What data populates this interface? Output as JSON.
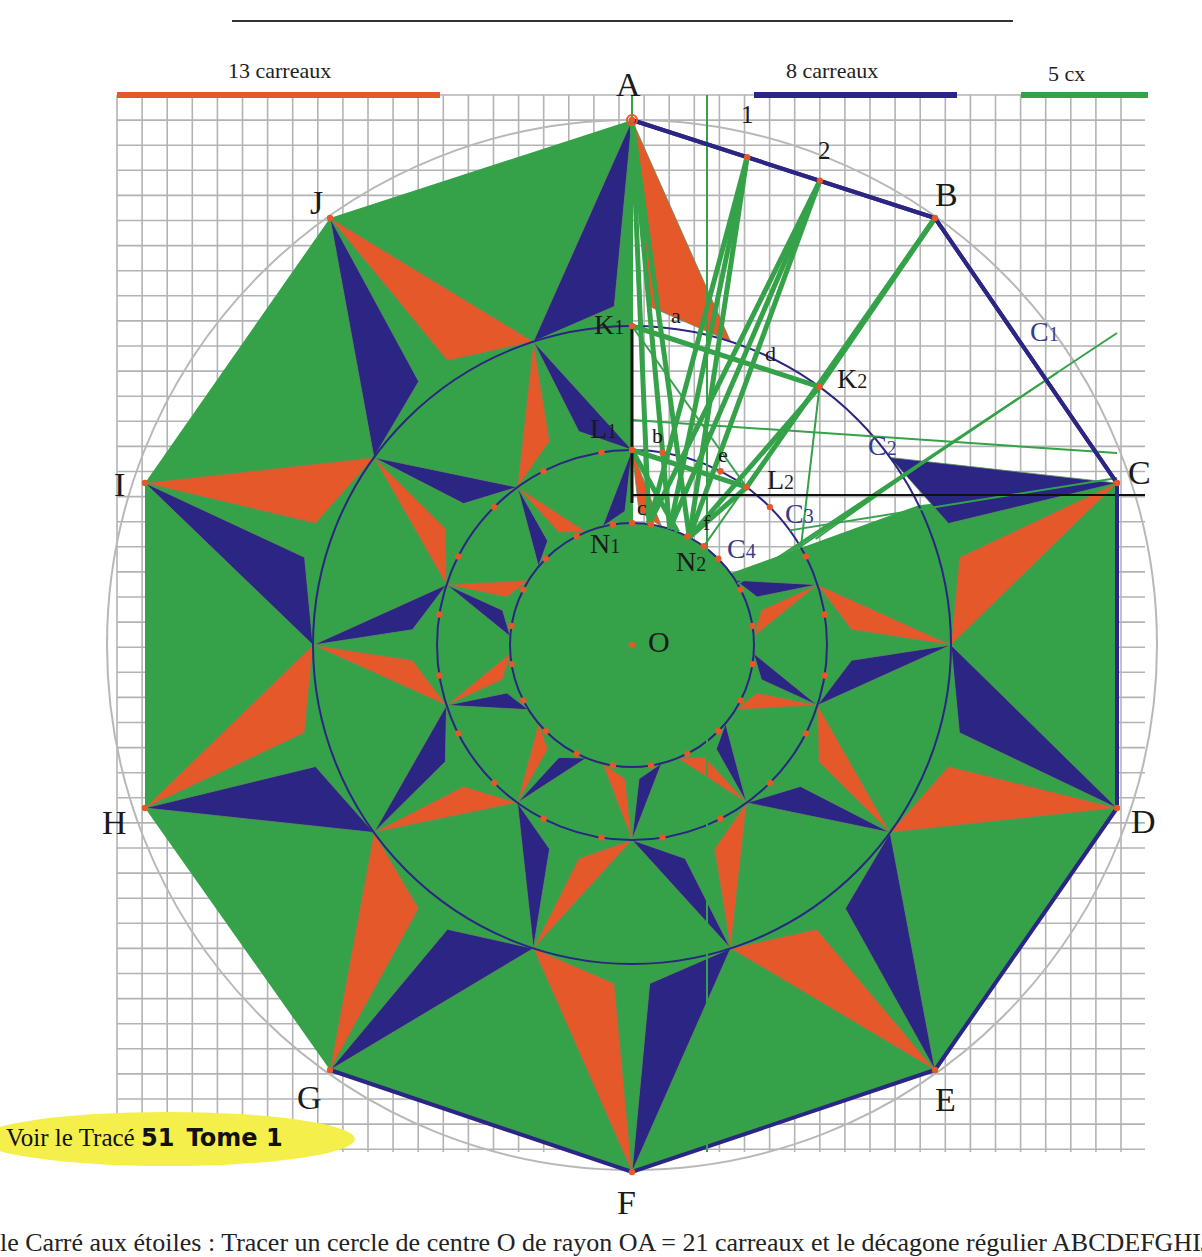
{
  "colors": {
    "green": "#35a24a",
    "orange": "#e4582a",
    "navy": "#2b2583",
    "grid": "#b3b3b3",
    "circle_grey": "#b8b8b8",
    "point": "#e4582a",
    "callout_bg": "#f4ef4a",
    "black": "#1a1a1a"
  },
  "geometry": {
    "center": [
      632,
      645
    ],
    "outer_radius": 525,
    "k_radius": 319,
    "l_radius": 195,
    "n_radius": 122,
    "grid": {
      "x0": 117,
      "y0": 95,
      "x1": 1145,
      "y1": 1152,
      "cell": 25.1
    }
  },
  "header_rule": {
    "x1": 232,
    "x2": 1013,
    "y": 21
  },
  "scales": [
    {
      "caption": "13 carreaux",
      "color": "#e4582a",
      "x1": 117,
      "x2": 440,
      "y": 95,
      "caption_x": 228,
      "caption_y": 58
    },
    {
      "caption": "8 carreaux",
      "color": "#2b2583",
      "x1": 754,
      "x2": 957,
      "y": 95,
      "caption_x": 786,
      "caption_y": 58
    },
    {
      "caption": "5 cx",
      "color": "#35a24a",
      "x1": 1021,
      "x2": 1148,
      "y": 95,
      "caption_x": 1048,
      "caption_y": 61
    }
  ],
  "vertices": [
    {
      "name": "A",
      "x": 632,
      "y": 120,
      "lx": 616,
      "ly": 68
    },
    {
      "name": "B",
      "x": 935,
      "y": 218,
      "lx": 935,
      "ly": 178
    },
    {
      "name": "C",
      "x": 1117,
      "y": 483,
      "lx": 1128,
      "ly": 456
    },
    {
      "name": "D",
      "x": 1117,
      "y": 808,
      "lx": 1131,
      "ly": 805
    },
    {
      "name": "E",
      "x": 935,
      "y": 1070,
      "lx": 935,
      "ly": 1083
    },
    {
      "name": "F",
      "x": 632,
      "y": 1172,
      "lx": 617,
      "ly": 1186
    },
    {
      "name": "G",
      "x": 330,
      "y": 1070,
      "lx": 297,
      "ly": 1081
    },
    {
      "name": "H",
      "x": 145,
      "y": 808,
      "lx": 102,
      "ly": 806
    },
    {
      "name": "I",
      "x": 145,
      "y": 483,
      "lx": 114,
      "ly": 468
    },
    {
      "name": "J",
      "x": 330,
      "y": 218,
      "lx": 310,
      "ly": 186
    }
  ],
  "labels": {
    "O": {
      "text": "O",
      "x": 648,
      "y": 627
    },
    "K1": {
      "main": "K",
      "sub": "1",
      "x": 594,
      "y": 311
    },
    "K2": {
      "main": "K",
      "sub": "2",
      "x": 837,
      "y": 365
    },
    "L1": {
      "main": "L",
      "sub": "1",
      "x": 590,
      "y": 415
    },
    "L2": {
      "main": "L",
      "sub": "2",
      "x": 767,
      "y": 466
    },
    "N1": {
      "main": "N",
      "sub": "1",
      "x": 590,
      "y": 530
    },
    "N2": {
      "main": "N",
      "sub": "2",
      "x": 676,
      "y": 548
    },
    "C1": {
      "main": "C",
      "sub": "1",
      "x": 1030,
      "y": 318
    },
    "C2": {
      "main": "C",
      "sub": "2",
      "x": 868,
      "y": 432
    },
    "C3": {
      "main": "C",
      "sub": "3",
      "x": 785,
      "y": 500
    },
    "C4": {
      "main": "C",
      "sub": "4",
      "x": 727,
      "y": 535
    },
    "a": {
      "text": "a",
      "x": 671,
      "y": 305
    },
    "b": {
      "text": "b",
      "x": 652,
      "y": 425
    },
    "c": {
      "text": "c",
      "x": 637,
      "y": 497
    },
    "d": {
      "text": "d",
      "x": 765,
      "y": 343
    },
    "e": {
      "text": "e",
      "x": 718,
      "y": 444
    },
    "f": {
      "text": "f",
      "x": 703,
      "y": 512
    },
    "1": {
      "text": "1",
      "x": 741,
      "y": 102
    },
    "2": {
      "text": "2",
      "x": 818,
      "y": 138
    }
  },
  "callout": {
    "prefix": "Voir le Tracé",
    "number": "51",
    "tome": "Tome 1"
  },
  "footer": {
    "text": "le Carré aux étoiles : Tracer un cercle de centre O de rayon OA = 21 carreaux et le décagone régulier ABCDEFGHIJ de côté"
  }
}
